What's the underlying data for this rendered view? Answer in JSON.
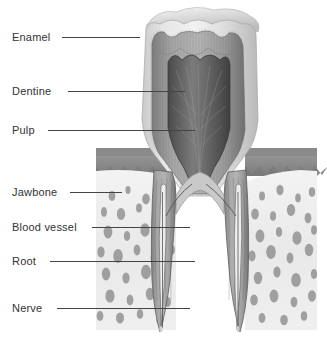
{
  "diagram": {
    "background": "#ffffff",
    "labels": [
      {
        "name": "enamel",
        "text": "Enamel",
        "x": 12,
        "y": 32,
        "line_x": 62,
        "line_y": 37,
        "line_w": 78
      },
      {
        "name": "dentine",
        "text": "Dentine",
        "x": 12,
        "y": 86,
        "line_x": 68,
        "line_y": 91,
        "line_w": 117
      },
      {
        "name": "pulp",
        "text": "Pulp",
        "x": 12,
        "y": 125,
        "line_x": 48,
        "line_y": 130,
        "line_w": 147
      },
      {
        "name": "jawbone",
        "text": "Jawbone",
        "x": 12,
        "y": 187,
        "line_x": 70,
        "line_y": 192,
        "line_w": 52
      },
      {
        "name": "blood-vessel",
        "text": "Blood vessel",
        "x": 12,
        "y": 222,
        "line_x": 92,
        "line_y": 227,
        "line_w": 98
      },
      {
        "name": "root",
        "text": "Root",
        "x": 12,
        "y": 256,
        "line_x": 50,
        "line_y": 261,
        "line_w": 145
      },
      {
        "name": "nerve",
        "text": "Nerve",
        "x": 12,
        "y": 303,
        "line_x": 57,
        "line_y": 308,
        "line_w": 133
      }
    ],
    "colors": {
      "text": "#333333",
      "leader_line": "#444444",
      "enamel": "#d8d8d8",
      "dentine": "#9a9a9a",
      "pulp": "#5a5a5a",
      "gum": "#8f8f8f",
      "jawbone": "#ebebeb",
      "trabecula": "#8a8a8a",
      "canal": "#707070",
      "outline": "#6b6b6b"
    },
    "structures": [
      {
        "name": "crown-enamel",
        "label": "Enamel"
      },
      {
        "name": "crown-dentine",
        "label": "Dentine"
      },
      {
        "name": "pulp-chamber",
        "label": "Pulp"
      },
      {
        "name": "gum-tissue",
        "label": "Gum"
      },
      {
        "name": "jawbone-trabecular",
        "label": "Jawbone"
      },
      {
        "name": "root-left",
        "label": "Root"
      },
      {
        "name": "root-right",
        "label": "Root"
      },
      {
        "name": "root-canal-nerve",
        "label": "Nerve"
      },
      {
        "name": "root-canal-vessel",
        "label": "Blood vessel"
      }
    ]
  }
}
